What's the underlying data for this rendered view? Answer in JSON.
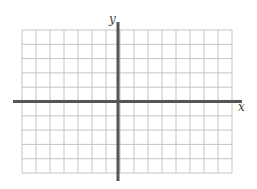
{
  "diagram": {
    "type": "coordinate-plane",
    "grid": {
      "columns": 15,
      "rows": 10,
      "left": 22,
      "top": 30,
      "right": 232,
      "bottom": 173,
      "line_color": "#c4c4c4"
    },
    "axes": {
      "y_axis_column": 7,
      "x_axis_row": 5,
      "color": "#555555",
      "x_extent": [
        13,
        242
      ],
      "y_extent": [
        22,
        181
      ]
    },
    "labels": {
      "x": "x",
      "y": "y"
    }
  }
}
